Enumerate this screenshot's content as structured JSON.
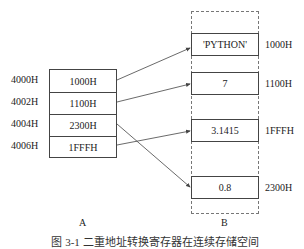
{
  "table_a": {
    "label": "A",
    "rows": [
      {
        "address": "4000H",
        "value": "1000H"
      },
      {
        "address": "4002H",
        "value": "1100H"
      },
      {
        "address": "4004H",
        "value": "2300H"
      },
      {
        "address": "4006H",
        "value": "1FFFH"
      }
    ]
  },
  "memory_b": {
    "label": "B",
    "cells": [
      {
        "value": "'PYTHON'",
        "address": "1000H"
      },
      {
        "value": "7",
        "address": "1100H"
      },
      {
        "value": "3.1415",
        "address": "1FFFH"
      },
      {
        "value": "0.8",
        "address": "2300H"
      }
    ]
  },
  "pointers": [
    {
      "from": "4000H",
      "to": "1000H"
    },
    {
      "from": "4002H",
      "to": "1100H"
    },
    {
      "from": "4004H",
      "to": "2300H"
    },
    {
      "from": "4006H",
      "to": "1FFFH"
    }
  ],
  "caption": "图 3-1  二重地址转换寄存器在连续存储空间",
  "colors": {
    "line": "#444444",
    "dashed": "#777777"
  }
}
